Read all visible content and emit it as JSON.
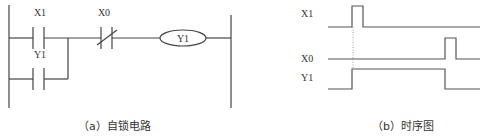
{
  "ladder": {
    "title": "(a) 自锁电路",
    "contacts": [
      {
        "name": "X1",
        "type": "normally-open"
      },
      {
        "name": "Y1",
        "type": "normally-open",
        "role": "latch-branch"
      },
      {
        "name": "X0",
        "type": "normally-closed"
      }
    ],
    "coil": {
      "name": "Y1"
    }
  },
  "timing": {
    "title": "(b) 时序图",
    "signals": [
      {
        "name": "X1",
        "description": "short pulse at t1"
      },
      {
        "name": "X0",
        "description": "short pulse at t2"
      },
      {
        "name": "Y1",
        "description": "high from t1 to t2"
      }
    ]
  },
  "captions": {
    "left": "（a）自锁电路",
    "right": "（b）时序图"
  },
  "labels": {
    "x1": "X1",
    "y1_contact": "Y1",
    "x0": "X0",
    "coil": "Y1",
    "t_x1": "X1",
    "t_x0": "X0",
    "t_y1": "Y1"
  }
}
